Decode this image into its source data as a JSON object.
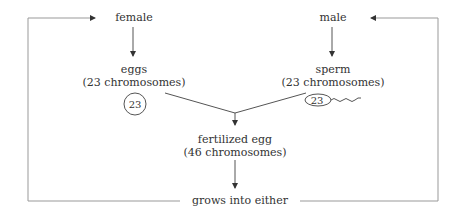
{
  "diagram": {
    "nodes": {
      "female": "female",
      "male": "male",
      "eggs": {
        "title": "eggs",
        "subtitle": "(23 chromosomes)",
        "icon_label": "23"
      },
      "sperm": {
        "title": "sperm",
        "subtitle": "(23 chromosomes)",
        "icon_label": "23"
      },
      "fertilized": {
        "title": "fertilized egg",
        "subtitle": "(46 chromosomes)"
      },
      "outcome": "grows into either"
    },
    "edges": [
      {
        "from": "female",
        "to": "eggs"
      },
      {
        "from": "male",
        "to": "sperm"
      },
      {
        "from": "eggs",
        "to": "fertilized"
      },
      {
        "from": "sperm",
        "to": "fertilized"
      },
      {
        "from": "fertilized",
        "to": "outcome"
      },
      {
        "from": "outcome",
        "to": "female"
      },
      {
        "from": "outcome",
        "to": "male"
      }
    ],
    "colors": {
      "line": "#555555",
      "text": "#333333",
      "loop_line": "#999999"
    }
  }
}
